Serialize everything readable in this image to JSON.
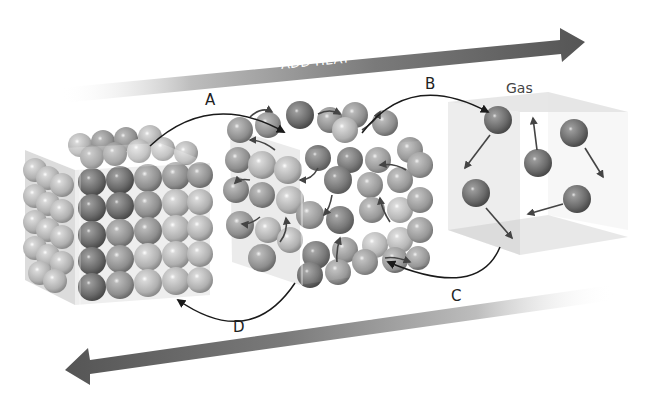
{
  "diagram": {
    "arrows": {
      "add_heat": "ADD HEAT",
      "remove_heat": "REMOVE HEAT"
    },
    "transitions": [
      {
        "id": "A",
        "label": "A",
        "from": "solid",
        "to": "liquid"
      },
      {
        "id": "B",
        "label": "B",
        "from": "liquid",
        "to": "gas"
      },
      {
        "id": "C",
        "label": "C",
        "from": "gas",
        "to": "liquid"
      },
      {
        "id": "D",
        "label": "D",
        "from": "liquid",
        "to": "solid"
      }
    ],
    "states": {
      "solid": {
        "label": ""
      },
      "liquid": {
        "label": ""
      },
      "gas": {
        "label": "Gas"
      }
    },
    "colors": {
      "arrow_dark": "#555555",
      "sphere_dark": "#6e6e6e",
      "sphere_light": "#c8c8c8",
      "connector": "#1a1a1a"
    }
  }
}
